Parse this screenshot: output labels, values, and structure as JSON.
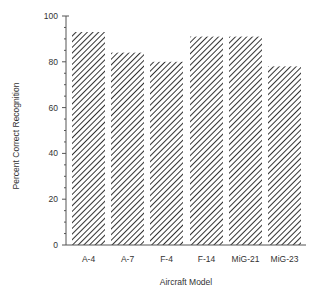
{
  "chart_data": {
    "type": "bar",
    "title": "",
    "xlabel": "Aircraft  Model",
    "ylabel": "Percent  Correct  Recognition",
    "categories": [
      "A-4",
      "A-7",
      "F-4",
      "F-14",
      "MiG-21",
      "MiG-23"
    ],
    "values": [
      93,
      84,
      80,
      91,
      91,
      78
    ],
    "ylim": [
      0,
      100
    ],
    "yticks": [
      0,
      20,
      40,
      60,
      80,
      100
    ],
    "grid": false,
    "legend": null,
    "fill_pattern": "diagonal-hatch"
  },
  "colors": {
    "axis": "#555555",
    "hatch": "#333333",
    "text": "#333333"
  }
}
